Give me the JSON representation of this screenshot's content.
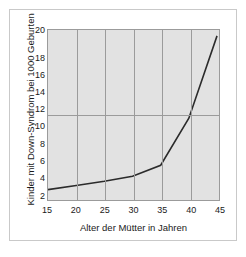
{
  "chart_data": {
    "type": "line",
    "title": "",
    "subtitle": "",
    "xlabel": "Alter der Mütter in Jahren",
    "ylabel": "Kinder mit Down-Syndrom bei 1000 Geburten",
    "x": [
      15,
      20,
      25,
      30,
      35,
      40,
      45
    ],
    "values": [
      1.0,
      1.5,
      2.0,
      2.6,
      3.9,
      9.5,
      19.3
    ],
    "series": [
      {
        "name": "Down-Syndrom Häufigkeit",
        "values": [
          1.0,
          1.5,
          2.0,
          2.6,
          3.9,
          9.5,
          19.3
        ]
      }
    ],
    "xlim": [
      15,
      45
    ],
    "ylim": [
      0,
      20
    ],
    "xticks": [
      "15",
      "20",
      "25",
      "30",
      "35",
      "40",
      "45"
    ],
    "yticks": [
      "2",
      "4",
      "6",
      "8",
      "10",
      "12",
      "14",
      "16",
      "18",
      "20"
    ],
    "grid": "both",
    "grid_x_values": [
      20,
      25,
      30,
      35,
      40
    ],
    "grid_y_values": [
      10
    ],
    "legend": "none",
    "colors": {
      "line": "#2b2b2b",
      "plot_background": "#e2e2e2",
      "grid": "#9b9b9b",
      "axis": "#9b9b9b",
      "text": "#1a1a1a",
      "frame_border": "#c9c9c9",
      "page_background": "#ffffff"
    }
  },
  "figure": {
    "frame_label": "chart-frame",
    "caption_fragment": ""
  }
}
